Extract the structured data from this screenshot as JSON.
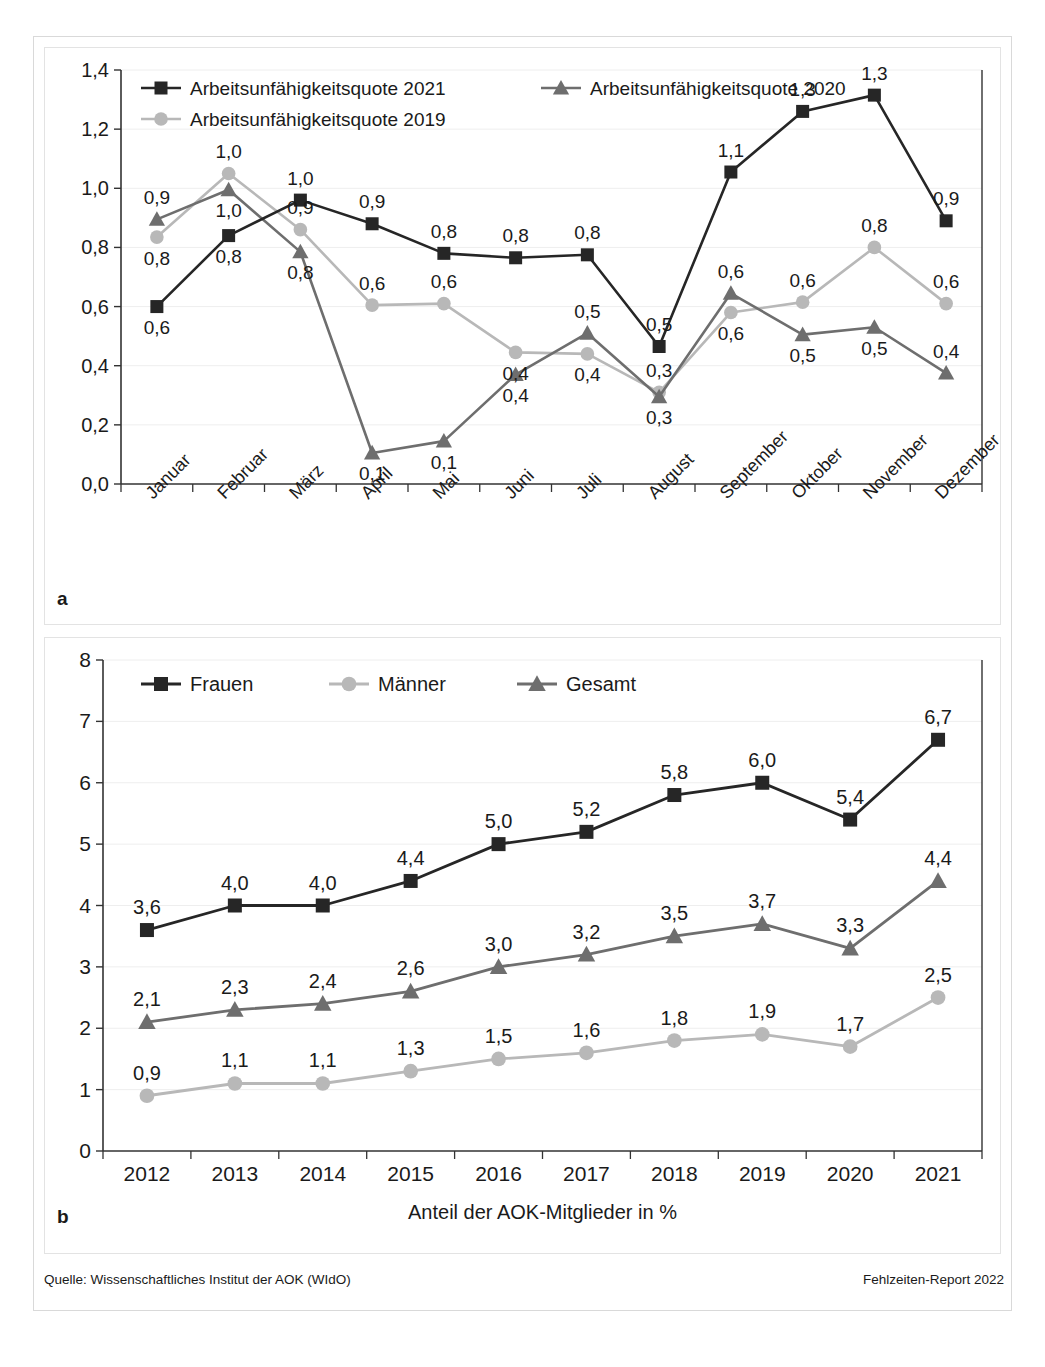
{
  "figure": {
    "panel_a_letter": "a",
    "panel_b_letter": "b",
    "source_label": "Quelle: Wissenschaftliches Institut der AOK (WIdO)",
    "report_label": "Fehlzeiten-Report 2022"
  },
  "colors": {
    "series_dark": "#262626",
    "series_mid": "#6e6e6e",
    "series_light": "#b8b8b8",
    "axis": "#333333",
    "grid": "#eeeeee",
    "frame": "#d9d9d9",
    "text": "#1a1a1a"
  },
  "chart_data": [
    {
      "id": "chart-a",
      "type": "line",
      "title": "",
      "xlabel": "",
      "ylabel": "",
      "ylim": [
        0,
        1.4
      ],
      "ytick_labels": [
        "0,0",
        "0,2",
        "0,4",
        "0,6",
        "0,8",
        "1,0",
        "1,2",
        "1,4"
      ],
      "ytick_values": [
        0,
        0.2,
        0.4,
        0.6,
        0.8,
        1.0,
        1.2,
        1.4
      ],
      "grid": true,
      "legend_position": "top-left-inside",
      "categories": [
        "Januar",
        "Februar",
        "März",
        "April",
        "Mai",
        "Juni",
        "Juli",
        "August",
        "September",
        "Oktober",
        "November",
        "Dezember"
      ],
      "series": [
        {
          "name": "Arbeitsunfähigkeitsquote 2021",
          "marker": "square",
          "color": "#262626",
          "values": [
            0.6,
            0.84,
            0.96,
            0.88,
            0.78,
            0.765,
            0.775,
            0.465,
            1.055,
            1.26,
            1.315,
            0.89
          ],
          "labels": [
            "0,6",
            "0,8",
            "1,0",
            "0,9",
            "0,8",
            "0,8",
            "0,8",
            "0,5",
            "1,1",
            "1,3",
            "1,3",
            "0,9"
          ],
          "label_pos": [
            "below",
            "below",
            "above",
            "above",
            "above",
            "above",
            "above",
            "above",
            "above",
            "above",
            "above",
            "above"
          ]
        },
        {
          "name": "Arbeitsunfähigkeitsquote 2020",
          "marker": "triangle",
          "color": "#6e6e6e",
          "values": [
            0.895,
            0.995,
            0.785,
            0.105,
            0.145,
            0.37,
            0.51,
            0.295,
            0.645,
            0.505,
            0.53,
            0.375
          ],
          "labels": [
            "0,9",
            "1,0",
            "0,8",
            "0,1",
            "0,1",
            "0,4",
            "0,5",
            "0,3",
            "0,6",
            "0,5",
            "0,5",
            "0,4"
          ],
          "label_pos": [
            "above",
            "below",
            "below",
            "below",
            "below",
            "below",
            "above",
            "below",
            "above",
            "below",
            "below",
            "above"
          ]
        },
        {
          "name": "Arbeitsunfähigkeitsquote 2019",
          "marker": "circle",
          "color": "#b8b8b8",
          "values": [
            0.835,
            1.05,
            0.86,
            0.605,
            0.61,
            0.445,
            0.44,
            0.31,
            0.58,
            0.615,
            0.8,
            0.61
          ],
          "labels": [
            "0,8",
            "1,0",
            "0,9",
            "0,6",
            "0,6",
            "0,4",
            "0,4",
            "0,3",
            "0,6",
            "0,6",
            "0,8",
            "0,6"
          ],
          "label_pos": [
            "below",
            "above",
            "above",
            "above",
            "above",
            "below",
            "below",
            "above",
            "below",
            "above",
            "above",
            "above"
          ]
        }
      ]
    },
    {
      "id": "chart-b",
      "type": "line",
      "title": "",
      "xlabel": "Anteil der AOK-Mitglieder in %",
      "ylabel": "",
      "ylim": [
        0,
        8
      ],
      "ytick_labels": [
        "0",
        "1",
        "2",
        "3",
        "4",
        "5",
        "6",
        "7",
        "8"
      ],
      "ytick_values": [
        0,
        1,
        2,
        3,
        4,
        5,
        6,
        7,
        8
      ],
      "grid": true,
      "legend_position": "top-left-inside",
      "categories": [
        "2012",
        "2013",
        "2014",
        "2015",
        "2016",
        "2017",
        "2018",
        "2019",
        "2020",
        "2021"
      ],
      "series": [
        {
          "name": "Frauen",
          "marker": "square",
          "color": "#262626",
          "values": [
            3.6,
            4.0,
            4.0,
            4.4,
            5.0,
            5.2,
            5.8,
            6.0,
            5.4,
            6.7
          ],
          "labels": [
            "3,6",
            "4,0",
            "4,0",
            "4,4",
            "5,0",
            "5,2",
            "5,8",
            "6,0",
            "5,4",
            "6,7"
          ],
          "label_pos": [
            "above",
            "above",
            "above",
            "above",
            "above",
            "above",
            "above",
            "above",
            "above",
            "above"
          ]
        },
        {
          "name": "Männer",
          "marker": "circle",
          "color": "#b8b8b8",
          "values": [
            0.9,
            1.1,
            1.1,
            1.3,
            1.5,
            1.6,
            1.8,
            1.9,
            1.7,
            2.5
          ],
          "labels": [
            "0,9",
            "1,1",
            "1,1",
            "1,3",
            "1,5",
            "1,6",
            "1,8",
            "1,9",
            "1,7",
            "2,5"
          ],
          "label_pos": [
            "above",
            "above",
            "above",
            "above",
            "above",
            "above",
            "above",
            "above",
            "above",
            "above"
          ]
        },
        {
          "name": "Gesamt",
          "marker": "triangle",
          "color": "#6e6e6e",
          "values": [
            2.1,
            2.3,
            2.4,
            2.6,
            3.0,
            3.2,
            3.5,
            3.7,
            3.3,
            4.4
          ],
          "labels": [
            "2,1",
            "2,3",
            "2,4",
            "2,6",
            "3,0",
            "3,2",
            "3,5",
            "3,7",
            "3,3",
            "4,4"
          ],
          "label_pos": [
            "above",
            "above",
            "above",
            "above",
            "above",
            "above",
            "above",
            "above",
            "above",
            "above"
          ]
        }
      ]
    }
  ]
}
